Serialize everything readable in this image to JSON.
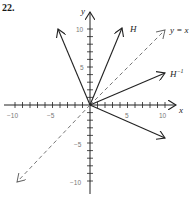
{
  "problem": {
    "number": "22."
  },
  "axes": {
    "x_label": "x",
    "y_label": "y",
    "x_ticks": [
      {
        "value": -10,
        "label": "−10"
      },
      {
        "value": -5,
        "label": "−5"
      },
      {
        "value": 5,
        "label": "5"
      },
      {
        "value": 10,
        "label": "10"
      }
    ],
    "y_ticks": [
      {
        "value": 10,
        "label": "10"
      },
      {
        "value": 5,
        "label": "5"
      },
      {
        "value": -5,
        "label": "−5"
      },
      {
        "value": -10,
        "label": "−10"
      }
    ],
    "range": [
      -10,
      10
    ]
  },
  "labels": {
    "H": "H",
    "H_inverse": "H",
    "H_inverse_sup": "−1",
    "line_yx": "y = x"
  },
  "chart_data": {
    "type": "vector-diagram",
    "title": "22.",
    "xlabel": "x",
    "ylabel": "y",
    "xlim": [
      -10,
      10
    ],
    "ylim": [
      -10,
      10
    ],
    "vectors": [
      {
        "name": "unlabeled-upper-left",
        "from": [
          0,
          0
        ],
        "to": [
          -4,
          10
        ],
        "style": "solid"
      },
      {
        "name": "H",
        "from": [
          0,
          0
        ],
        "to": [
          4,
          10
        ],
        "style": "solid"
      },
      {
        "name": "y = x",
        "from": [
          -10,
          -10
        ],
        "to": [
          10,
          10
        ],
        "style": "dashed",
        "double_headed": true
      },
      {
        "name": "H^-1",
        "from": [
          0,
          0
        ],
        "to": [
          10,
          4
        ],
        "style": "solid"
      },
      {
        "name": "unlabeled-lower-right",
        "from": [
          0,
          0
        ],
        "to": [
          10,
          -4
        ],
        "style": "solid"
      }
    ],
    "grid": false
  }
}
